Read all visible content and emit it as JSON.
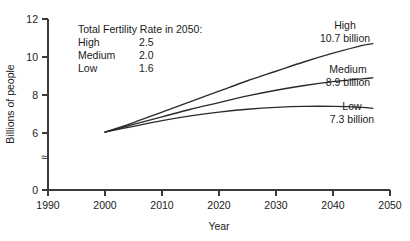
{
  "chart_data": {
    "type": "line",
    "title": "",
    "xlabel": "Year",
    "ylabel": "Billions of people",
    "xlim": [
      1990,
      2050
    ],
    "ylim": [
      0,
      12
    ],
    "grid": false,
    "legend_position": "inside-top-left",
    "x_ticks": [
      "1990",
      "2000",
      "2010",
      "2020",
      "2030",
      "2040",
      "2050"
    ],
    "y_ticks": [
      "0",
      "6",
      "8",
      "10",
      "12"
    ],
    "y_axis_break": "≈",
    "x": [
      2000,
      2005,
      2010,
      2015,
      2020,
      2025,
      2030,
      2035,
      2040,
      2045,
      2047
    ],
    "series": [
      {
        "name": "High",
        "end_label": "High",
        "end_value_label": "10.7 billion",
        "values": [
          6.05,
          6.55,
          7.1,
          7.65,
          8.2,
          8.75,
          9.25,
          9.75,
          10.2,
          10.6,
          10.7
        ]
      },
      {
        "name": "Medium",
        "end_label": "Medium",
        "end_value_label": "8.9 billion",
        "values": [
          6.05,
          6.45,
          6.85,
          7.25,
          7.6,
          7.95,
          8.25,
          8.5,
          8.7,
          8.85,
          8.9
        ]
      },
      {
        "name": "Low",
        "end_label": "Low",
        "end_value_label": "7.3 billion",
        "values": [
          6.05,
          6.35,
          6.65,
          6.9,
          7.1,
          7.25,
          7.35,
          7.4,
          7.4,
          7.35,
          7.3
        ]
      }
    ],
    "annotation": {
      "title": "Total Fertility Rate in 2050:",
      "rows": [
        {
          "label": "High",
          "value": "2.5"
        },
        {
          "label": "Medium",
          "value": "2.0"
        },
        {
          "label": "Low",
          "value": "1.6"
        }
      ]
    },
    "colors": {
      "line": "#2b2b2b",
      "axis": "#3a3a3a",
      "text": "#1a1a1a",
      "background": "#ffffff"
    }
  }
}
